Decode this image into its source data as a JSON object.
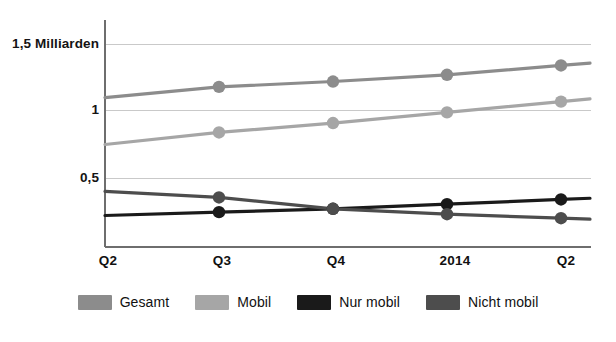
{
  "chart_data": {
    "type": "line",
    "title": "",
    "subtitle": "",
    "xlabel": "",
    "ylabel": "",
    "categories": [
      "Q2",
      "Q3",
      "Q4",
      "2014",
      "Q2"
    ],
    "ylim": [
      0,
      1.5
    ],
    "yticks": [
      0.5,
      1,
      1.5
    ],
    "ytick_labels": [
      "0,5",
      "1",
      "1,5 Milliarden"
    ],
    "grid": true,
    "legend_position": "bottom",
    "series": [
      {
        "name": "Gesamt",
        "color": "#8c8c8c",
        "values": [
          1.1,
          1.18,
          1.22,
          1.27,
          1.34
        ]
      },
      {
        "name": "Mobil",
        "color": "#a6a6a6",
        "values": [
          0.75,
          0.84,
          0.91,
          0.99,
          1.07
        ]
      },
      {
        "name": "Nur mobil",
        "color": "#1a1a1a",
        "values": [
          0.22,
          0.245,
          0.27,
          0.305,
          0.34
        ]
      },
      {
        "name": "Nicht mobil",
        "color": "#4d4d4d",
        "values": [
          0.4,
          0.355,
          0.27,
          0.23,
          0.2
        ]
      }
    ]
  },
  "axis": {
    "ytick_0": "0,5",
    "ytick_1": "1",
    "ytick_2": "1,5 Milliarden",
    "xtick_0": "Q2",
    "xtick_1": "Q3",
    "xtick_2": "Q4",
    "xtick_3": "2014",
    "xtick_4": "Q2"
  },
  "legend": {
    "item_0": "Gesamt",
    "item_1": "Mobil",
    "item_2": "Nur mobil",
    "item_3": "Nicht mobil"
  },
  "colors": {
    "gesamt": "#8c8c8c",
    "mobil": "#a6a6a6",
    "nur_mobil": "#1a1a1a",
    "nicht_mobil": "#4d4d4d",
    "axis": "#6e6e6e",
    "grid": "#c9c9c9",
    "text": "#111111",
    "background": "#ffffff"
  }
}
